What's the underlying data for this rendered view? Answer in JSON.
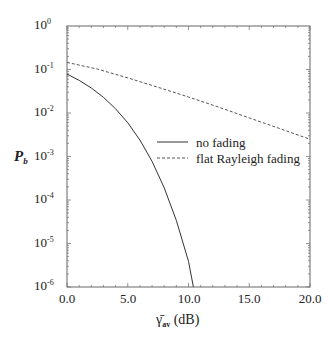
{
  "chart_data": {
    "type": "line",
    "title": "",
    "xlabel": "γ̄_av (dB)",
    "ylabel": "P_b",
    "xlim": [
      0,
      20
    ],
    "ylim": [
      1e-06,
      1
    ],
    "yscale": "log",
    "grid": false,
    "legend_position": "center-right",
    "x_ticks": [
      "0.0",
      "5.0",
      "10.0",
      "15.0",
      "20.0"
    ],
    "y_ticks": [
      "10^0",
      "10^-1",
      "10^-2",
      "10^-3",
      "10^-4",
      "10^-5",
      "10^-6"
    ],
    "series": [
      {
        "name": "no fading",
        "style": "solid",
        "x": [
          0,
          1,
          2,
          3,
          4,
          5,
          6,
          7,
          8,
          9,
          10,
          10.4
        ],
        "values": [
          0.0786,
          0.0563,
          0.0375,
          0.0229,
          0.0125,
          0.00595,
          0.00239,
          0.000773,
          0.000191,
          3.36e-05,
          3.87e-06,
          1e-06
        ]
      },
      {
        "name": "flat Rayleigh fading",
        "style": "dashed",
        "x": [
          0,
          2.5,
          5,
          7.5,
          10,
          12.5,
          15,
          17.5,
          20
        ],
        "values": [
          0.146,
          0.102,
          0.0642,
          0.039,
          0.0233,
          0.0136,
          0.00773,
          0.00441,
          0.00248
        ]
      }
    ]
  },
  "axes": {
    "x_ticks": [
      {
        "label": "0.0",
        "px": 67
      },
      {
        "label": "5.0",
        "px": 128
      },
      {
        "label": "10.0",
        "px": 189
      },
      {
        "label": "15.0",
        "px": 249
      },
      {
        "label": "20.0",
        "px": 310
      }
    ],
    "y_ticks": [
      {
        "base": "10",
        "exp": "0",
        "py": 26
      },
      {
        "base": "10",
        "exp": "-1",
        "py": 70
      },
      {
        "base": "10",
        "exp": "-2",
        "py": 113
      },
      {
        "base": "10",
        "exp": "-3",
        "py": 157
      },
      {
        "base": "10",
        "exp": "-4",
        "py": 200
      },
      {
        "base": "10",
        "exp": "-5",
        "py": 244
      },
      {
        "base": "10",
        "exp": "-6",
        "py": 287
      }
    ],
    "ylabel_main": "P",
    "ylabel_sub": "b",
    "xlabel_symbol": "γ̄",
    "xlabel_sub": "av",
    "xlabel_unit": " (dB)"
  },
  "legend": {
    "items": [
      {
        "label": "no fading",
        "style": "solid"
      },
      {
        "label": "flat Rayleigh fading",
        "style": "dashed"
      }
    ]
  },
  "colors": {
    "line": "#333333",
    "axis": "#555555",
    "text": "#222222"
  }
}
